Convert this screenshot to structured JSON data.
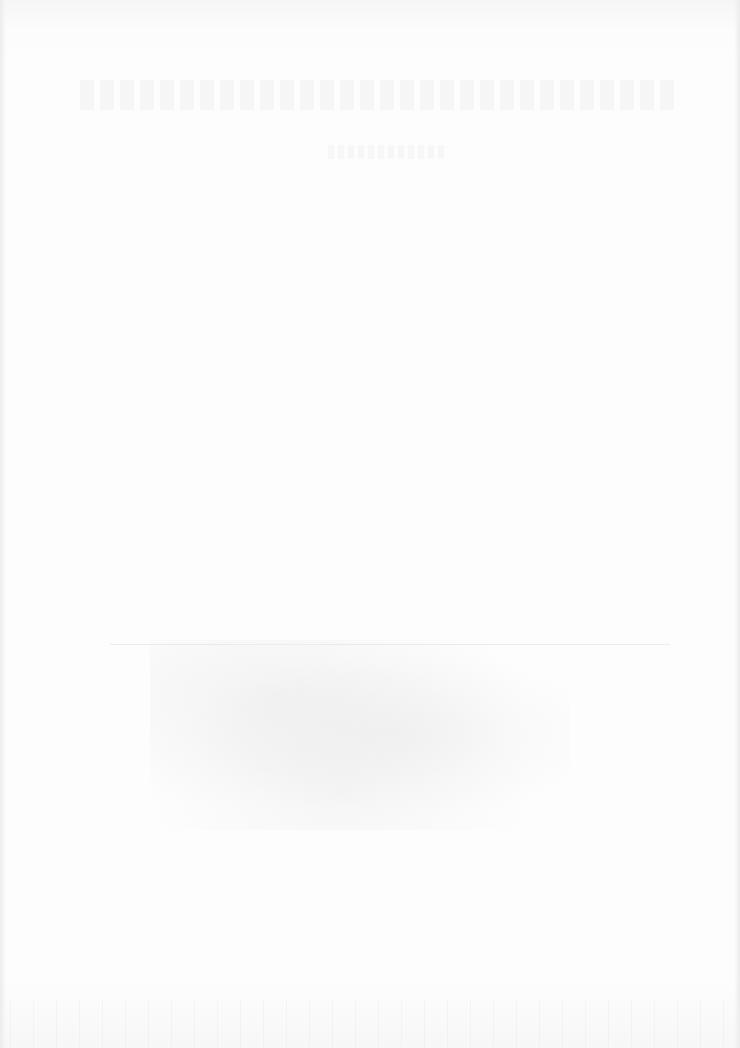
{
  "document": {
    "type": "scanned-page",
    "state": "blank-with-bleed-through",
    "legible_text": []
  }
}
